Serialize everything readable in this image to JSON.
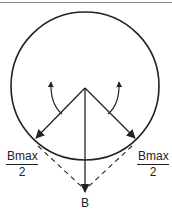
{
  "diagram": {
    "type": "phasor-circle",
    "labels": {
      "left_fraction": {
        "numerator": "Bmax",
        "denominator": "2"
      },
      "right_fraction": {
        "numerator": "Bmax",
        "denominator": "2"
      },
      "resultant": "B"
    },
    "colors": {
      "stroke": "#222222",
      "top_rule": "#8a8a8a",
      "background": "#ffffff"
    }
  }
}
